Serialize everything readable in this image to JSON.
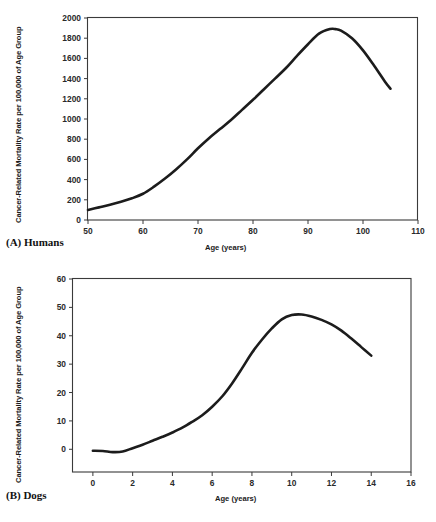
{
  "figure": {
    "panels": [
      {
        "id": "a",
        "caption": "(A) Humans",
        "ylabel": "Cancer-Related Mortality Rate per 100,000 of Age Group",
        "xlabel": "Age (years)",
        "ytick_labels": [
          "0",
          "200",
          "400",
          "600",
          "800",
          "1000",
          "1200",
          "1400",
          "1600",
          "1800",
          "2000"
        ],
        "xtick_labels": [
          "50",
          "60",
          "70",
          "80",
          "90",
          "100",
          "110"
        ]
      },
      {
        "id": "b",
        "caption": "(B) Dogs",
        "ylabel": "Cancer-Related Mortality Rate per 100,000 of Age Group",
        "xlabel": "Age (years)",
        "ytick_labels": [
          "0",
          "10",
          "20",
          "30",
          "40",
          "50",
          "60"
        ],
        "xtick_labels": [
          "0",
          "2",
          "4",
          "6",
          "8",
          "10",
          "12",
          "14",
          "16"
        ]
      }
    ]
  },
  "chart_data": [
    {
      "type": "line",
      "panel": "A",
      "title": "(A) Humans",
      "xlabel": "Age (years)",
      "ylabel": "Cancer-Related Mortality Rate per 100,000 of Age Group",
      "xlim": [
        50,
        110
      ],
      "ylim": [
        0,
        2000
      ],
      "xticks": [
        50,
        60,
        70,
        80,
        90,
        100,
        110
      ],
      "yticks": [
        0,
        200,
        400,
        600,
        800,
        1000,
        1200,
        1400,
        1600,
        1800,
        2000
      ],
      "grid": false,
      "legend": "none",
      "series": [
        {
          "name": "Human cancer-related mortality rate",
          "x": [
            50,
            52,
            54,
            56,
            58,
            60,
            62,
            64,
            66,
            68,
            70,
            72,
            74,
            76,
            78,
            80,
            82,
            84,
            86,
            88,
            90,
            92,
            94,
            95,
            96,
            98,
            100,
            102,
            104,
            105
          ],
          "y": [
            100,
            125,
            150,
            180,
            215,
            260,
            330,
            410,
            500,
            600,
            710,
            810,
            900,
            990,
            1090,
            1190,
            1295,
            1400,
            1505,
            1625,
            1740,
            1845,
            1890,
            1890,
            1875,
            1800,
            1680,
            1530,
            1370,
            1300
          ]
        }
      ],
      "annotations": {
        "peak_age": 94.5,
        "peak_value": 1890,
        "start_value": 100,
        "end_age": 105,
        "end_value": 1300
      }
    },
    {
      "type": "line",
      "panel": "B",
      "title": "(B) Dogs",
      "xlabel": "Age (years)",
      "ylabel": "Cancer-Related Mortality Rate per 100,000 of Age Group",
      "xlim": [
        -1,
        16
      ],
      "ylim": [
        -8,
        60
      ],
      "xticks": [
        0,
        2,
        4,
        6,
        8,
        10,
        12,
        14,
        16
      ],
      "yticks": [
        0,
        10,
        20,
        30,
        40,
        50,
        60
      ],
      "grid": false,
      "legend": "none",
      "series": [
        {
          "name": "Dog cancer-related mortality rate",
          "x": [
            0,
            0.5,
            1,
            1.5,
            2,
            2.5,
            3,
            3.5,
            4,
            4.5,
            5,
            5.5,
            6,
            6.5,
            7,
            7.5,
            8,
            8.5,
            9,
            9.5,
            10,
            10.5,
            11,
            11.5,
            12,
            12.5,
            13,
            13.5,
            14
          ],
          "y": [
            -0.5,
            -0.6,
            -1.0,
            -0.8,
            0.4,
            1.6,
            3.0,
            4.4,
            5.9,
            7.6,
            9.7,
            12.0,
            15.0,
            18.6,
            23.2,
            28.5,
            34.0,
            38.6,
            42.6,
            45.8,
            47.3,
            47.5,
            46.8,
            45.6,
            44.0,
            41.8,
            39.0,
            36.0,
            33.0
          ]
        }
      ],
      "annotations": {
        "peak_age": 10.3,
        "peak_value": 47.5,
        "start_value": -0.5,
        "end_age": 14,
        "end_value": 33
      }
    }
  ]
}
